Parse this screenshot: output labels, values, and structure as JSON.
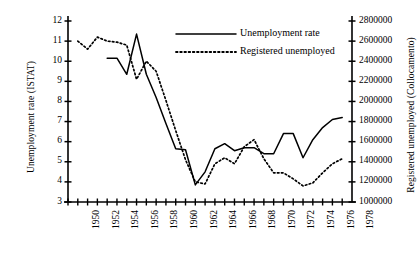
{
  "chart_data": {
    "type": "line",
    "title": "",
    "xlabel": "",
    "ylabel": "Unemployment rate (ISTAT)",
    "y2label": "Registered unemployed (Collocamento)",
    "grid": false,
    "legend_position": "top-right",
    "xlim": [
      1950,
      1979
    ],
    "ylim": [
      3,
      12
    ],
    "y2lim": [
      1000000,
      2800000
    ],
    "x_ticks_all": [
      1950,
      1951,
      1952,
      1953,
      1954,
      1955,
      1956,
      1957,
      1958,
      1959,
      1960,
      1961,
      1962,
      1963,
      1964,
      1965,
      1966,
      1967,
      1968,
      1969,
      1970,
      1971,
      1972,
      1973,
      1974,
      1975,
      1976,
      1977,
      1978
    ],
    "x_tick_labels": [
      "1950",
      "1952",
      "1954",
      "1956",
      "1958",
      "1960",
      "1962",
      "1964",
      "1966",
      "1968",
      "1970",
      "1972",
      "1974",
      "1976",
      "1978"
    ],
    "x_tick_label_values": [
      1950,
      1952,
      1954,
      1956,
      1958,
      1960,
      1962,
      1964,
      1966,
      1968,
      1970,
      1972,
      1974,
      1976,
      1978
    ],
    "y_tick_labels": [
      "12",
      "11",
      "10",
      "9",
      "8",
      "7",
      "6",
      "5",
      "4",
      "3"
    ],
    "y_tick_values": [
      12,
      11,
      10,
      9,
      8,
      7,
      6,
      5,
      4,
      3
    ],
    "y2_tick_labels": [
      "2800000",
      "2600000",
      "2400000",
      "2200000",
      "2000000",
      "1800000",
      "1600000",
      "1400000",
      "1200000",
      "1000000"
    ],
    "y2_tick_values": [
      2800000,
      2600000,
      2400000,
      2200000,
      2000000,
      1800000,
      1600000,
      1400000,
      1200000,
      1000000
    ],
    "series": [
      {
        "name": "Unemployment rate",
        "style": "solid",
        "axis": "left",
        "color": "#000000",
        "x": [
          1954,
          1955,
          1956,
          1957,
          1958,
          1959,
          1960,
          1961,
          1962,
          1963,
          1964,
          1965,
          1966,
          1967,
          1968,
          1969,
          1970,
          1971,
          1972,
          1973,
          1974,
          1975,
          1976,
          1977,
          1978
        ],
        "values": [
          10.15,
          10.15,
          9.35,
          11.35,
          9.35,
          8.2,
          6.9,
          5.65,
          5.6,
          3.85,
          4.5,
          5.65,
          5.9,
          5.55,
          5.7,
          5.7,
          5.4,
          5.4,
          6.4,
          6.4,
          5.2,
          6.1,
          6.7,
          7.1,
          7.2
        ]
      },
      {
        "name": "Registered unemployed",
        "style": "dotted",
        "axis": "right",
        "color": "#000000",
        "x": [
          1951,
          1952,
          1953,
          1954,
          1955,
          1956,
          1957,
          1958,
          1959,
          1960,
          1961,
          1962,
          1963,
          1964,
          1965,
          1966,
          1967,
          1968,
          1969,
          1970,
          1971,
          1972,
          1973,
          1974,
          1975,
          1976,
          1977,
          1978
        ],
        "values": [
          2600000,
          2520000,
          2640000,
          2600000,
          2590000,
          2560000,
          2220000,
          2400000,
          2300000,
          2010000,
          1710000,
          1420000,
          1200000,
          1180000,
          1380000,
          1440000,
          1380000,
          1550000,
          1620000,
          1430000,
          1290000,
          1290000,
          1230000,
          1160000,
          1190000,
          1290000,
          1380000,
          1430000
        ]
      }
    ]
  },
  "legend": {
    "items": [
      {
        "label": "Unemployment rate",
        "style": "solid"
      },
      {
        "label": "Registered unemployed",
        "style": "dotted"
      }
    ]
  }
}
